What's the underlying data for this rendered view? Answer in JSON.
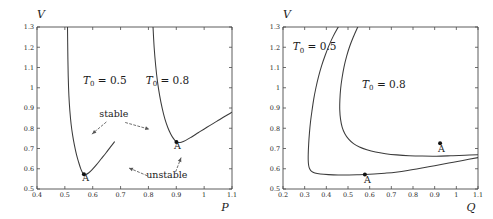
{
  "figure": {
    "title": "",
    "panel_count": 2
  },
  "chart_data": [
    {
      "type": "line",
      "panel": "left",
      "title": "",
      "xlabel": "P",
      "ylabel": "V",
      "xlim": [
        0.4,
        1.1
      ],
      "ylim": [
        0.5,
        1.3
      ],
      "xticks": [
        0.4,
        0.5,
        0.6,
        0.7,
        0.8,
        0.9,
        1.0,
        1.1
      ],
      "xticklabels": [
        "0.4",
        "0.5",
        "0.6",
        "0.7",
        "0.8",
        "0.9",
        "1",
        "1.1"
      ],
      "yticks": [
        0.5,
        0.6,
        0.7,
        0.8,
        0.9,
        1.0,
        1.1,
        1.2,
        1.3
      ],
      "yticklabels": [
        "0.5",
        "0.6",
        "0.7",
        "0.8",
        "0.9",
        "1",
        "1.1",
        "1.2",
        "1.3"
      ],
      "grid": false,
      "legend": "none",
      "series": [
        {
          "name": "T0 = 0.5",
          "label": "T_0 = 0.5",
          "label_x": 0.565,
          "label_y": 1.02,
          "points": [
            [
              0.5095,
              1.3
            ],
            [
              0.5105,
              1.18
            ],
            [
              0.512,
              1.06
            ],
            [
              0.5145,
              0.96
            ],
            [
              0.518,
              0.885
            ],
            [
              0.5225,
              0.82
            ],
            [
              0.528,
              0.765
            ],
            [
              0.5345,
              0.715
            ],
            [
              0.542,
              0.668
            ],
            [
              0.5495,
              0.632
            ],
            [
              0.5565,
              0.602
            ],
            [
              0.563,
              0.582
            ],
            [
              0.5685,
              0.573
            ],
            [
              0.575,
              0.572
            ],
            [
              0.585,
              0.579
            ],
            [
              0.598,
              0.596
            ],
            [
              0.613,
              0.619
            ],
            [
              0.63,
              0.648
            ],
            [
              0.648,
              0.679
            ],
            [
              0.664,
              0.708
            ],
            [
              0.678,
              0.733
            ]
          ]
        },
        {
          "name": "T0 = 0.8",
          "label": "T_0 = 0.8",
          "label_x": 0.79,
          "label_y": 1.02,
          "points": [
            [
              0.8165,
              1.3
            ],
            [
              0.8205,
              1.2
            ],
            [
              0.826,
              1.11
            ],
            [
              0.8325,
              1.03
            ],
            [
              0.8405,
              0.96
            ],
            [
              0.8495,
              0.898
            ],
            [
              0.859,
              0.846
            ],
            [
              0.8695,
              0.804
            ],
            [
              0.88,
              0.772
            ],
            [
              0.8895,
              0.75
            ],
            [
              0.898,
              0.736
            ],
            [
              0.907,
              0.73
            ],
            [
              0.918,
              0.731
            ],
            [
              0.934,
              0.74
            ],
            [
              0.955,
              0.757
            ],
            [
              0.98,
              0.779
            ],
            [
              1.01,
              0.805
            ],
            [
              1.045,
              0.834
            ],
            [
              1.075,
              0.859
            ],
            [
              1.1,
              0.879
            ]
          ]
        }
      ],
      "markers": [
        {
          "label": "A",
          "x": 0.5685,
          "y": 0.573,
          "label_dx": 0.006,
          "label_dy": -0.035
        },
        {
          "label": "A",
          "x": 0.9005,
          "y": 0.7315,
          "label_dx": 0.004,
          "label_dy": -0.035
        }
      ],
      "annotations": [
        {
          "text": "stable",
          "x": 0.676,
          "y": 0.855,
          "arrows": [
            {
              "from": [
                0.648,
                0.83
              ],
              "to": [
                0.598,
                0.772
              ]
            },
            {
              "from": [
                0.718,
                0.828
              ],
              "to": [
                0.803,
                0.795
              ]
            }
          ]
        },
        {
          "text": "unstable",
          "x": 0.866,
          "y": 0.556,
          "arrows": [
            {
              "from": [
                0.795,
                0.566
              ],
              "to": [
                0.73,
                0.604
              ]
            },
            {
              "from": [
                0.898,
                0.586
              ],
              "to": [
                0.917,
                0.654
              ]
            }
          ]
        }
      ]
    },
    {
      "type": "line",
      "panel": "right",
      "title": "",
      "xlabel": "Q",
      "ylabel": "V",
      "xlim": [
        0.2,
        1.1
      ],
      "ylim": [
        0.5,
        1.3
      ],
      "xticks": [
        0.2,
        0.3,
        0.4,
        0.5,
        0.6,
        0.7,
        0.8,
        0.9,
        1.0,
        1.1
      ],
      "xticklabels": [
        "0.2",
        "0.3",
        "0.4",
        "0.5",
        "0.6",
        "0.7",
        "0.8",
        "0.9",
        "1",
        "1.1"
      ],
      "yticks": [
        0.5,
        0.6,
        0.7,
        0.8,
        0.9,
        1.0,
        1.1,
        1.2,
        1.3
      ],
      "yticklabels": [
        "0.5",
        "0.6",
        "0.7",
        "0.8",
        "0.9",
        "1",
        "1.1",
        "1.2",
        "1.3"
      ],
      "grid": false,
      "legend": "none",
      "series": [
        {
          "name": "T0 = 0.5",
          "label": "T_0 = 0.5",
          "label_x": 0.245,
          "label_y": 1.185,
          "points": [
            [
              0.455,
              1.3
            ],
            [
              0.432,
              1.255
            ],
            [
              0.412,
              1.208
            ],
            [
              0.394,
              1.158
            ],
            [
              0.378,
              1.108
            ],
            [
              0.364,
              1.055
            ],
            [
              0.352,
              1.0
            ],
            [
              0.342,
              0.945
            ],
            [
              0.334,
              0.888
            ],
            [
              0.327,
              0.832
            ],
            [
              0.322,
              0.776
            ],
            [
              0.3185,
              0.722
            ],
            [
              0.3165,
              0.672
            ],
            [
              0.3165,
              0.64
            ],
            [
              0.3185,
              0.616
            ],
            [
              0.323,
              0.6
            ],
            [
              0.332,
              0.587
            ],
            [
              0.347,
              0.579
            ],
            [
              0.372,
              0.574
            ],
            [
              0.41,
              0.571
            ],
            [
              0.455,
              0.5695
            ],
            [
              0.505,
              0.5695
            ],
            [
              0.548,
              0.5705
            ],
            [
              0.578,
              0.5715
            ],
            [
              0.62,
              0.574
            ],
            [
              0.67,
              0.578
            ],
            [
              0.72,
              0.583
            ],
            [
              0.775,
              0.591
            ],
            [
              0.835,
              0.602
            ],
            [
              0.9,
              0.615
            ],
            [
              0.965,
              0.628
            ],
            [
              1.03,
              0.641
            ],
            [
              1.1,
              0.655
            ]
          ]
        },
        {
          "name": "T0 = 0.8",
          "label": "T_0 = 0.8",
          "label_x": 0.565,
          "label_y": 1.0,
          "points": [
            [
              0.545,
              1.3
            ],
            [
              0.525,
              1.252
            ],
            [
              0.508,
              1.205
            ],
            [
              0.4935,
              1.155
            ],
            [
              0.4815,
              1.102
            ],
            [
              0.4725,
              1.048
            ],
            [
              0.466,
              0.995
            ],
            [
              0.4625,
              0.94
            ],
            [
              0.462,
              0.89
            ],
            [
              0.4655,
              0.845
            ],
            [
              0.473,
              0.806
            ],
            [
              0.4855,
              0.773
            ],
            [
              0.503,
              0.746
            ],
            [
              0.5255,
              0.724
            ],
            [
              0.553,
              0.707
            ],
            [
              0.587,
              0.6935
            ],
            [
              0.627,
              0.6825
            ],
            [
              0.673,
              0.6745
            ],
            [
              0.725,
              0.6685
            ],
            [
              0.782,
              0.6645
            ],
            [
              0.843,
              0.6625
            ],
            [
              0.908,
              0.662
            ],
            [
              0.975,
              0.664
            ],
            [
              1.04,
              0.6665
            ],
            [
              1.1,
              0.6695
            ]
          ]
        }
      ],
      "markers": [
        {
          "label": "A",
          "x": 0.578,
          "y": 0.5715,
          "label_dx": 0.012,
          "label_dy": -0.042
        },
        {
          "label": "A",
          "x": 0.925,
          "y": 0.7255,
          "label_dx": 0.006,
          "label_dy": -0.042
        }
      ],
      "annotations": []
    }
  ],
  "labels": {
    "V": "V",
    "P": "P",
    "Q": "Q",
    "T_symbol": "T",
    "T_subscript": "0",
    "equals": " = ",
    "t_low": "0.5",
    "t_high": "0.8",
    "point_A": "A",
    "stable": "stable",
    "unstable": "unstable"
  }
}
